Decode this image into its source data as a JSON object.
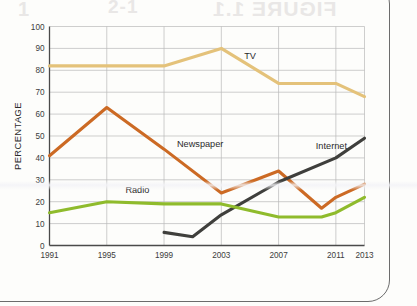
{
  "page": {
    "background_color": "#fdfdfb",
    "frame_color": "#6c6c6c",
    "bleed_through": {
      "left": "1",
      "middle": "2-1",
      "right": "FIGURE 1.1"
    }
  },
  "chart_data": {
    "type": "line",
    "title": "",
    "subtitle": "",
    "xlabel": "",
    "ylabel": "PERCENTAGE",
    "x": [
      1991,
      1995,
      1999,
      2003,
      2007,
      2011,
      2013
    ],
    "xticklabels": [
      "1991",
      "1995",
      "1999",
      "2003",
      "2007",
      "2011",
      "2013"
    ],
    "xlim": [
      1991,
      2013
    ],
    "ylim": [
      0,
      100
    ],
    "yticks": [
      0,
      10,
      20,
      30,
      40,
      50,
      60,
      70,
      80,
      90,
      100
    ],
    "yticklabels": [
      "0",
      "10",
      "20",
      "30",
      "40",
      "50",
      "60",
      "70",
      "80",
      "90",
      "100"
    ],
    "grid": true,
    "grid_color": "#b9b9b9",
    "legend_position": "inline-labels",
    "series": [
      {
        "name": "TV",
        "color": "#e4c27a",
        "label_x": 2004.6,
        "label_y": 85,
        "points": [
          {
            "x": 1991,
            "y": 82
          },
          {
            "x": 1995,
            "y": 82
          },
          {
            "x": 1999,
            "y": 82
          },
          {
            "x": 2003,
            "y": 90
          },
          {
            "x": 2007,
            "y": 74
          },
          {
            "x": 2011,
            "y": 74
          },
          {
            "x": 2013,
            "y": 68
          }
        ]
      },
      {
        "name": "Newspaper",
        "color": "#cc6a24",
        "label_x": 1999.9,
        "label_y": 45,
        "points": [
          {
            "x": 1991,
            "y": 41
          },
          {
            "x": 1995,
            "y": 63
          },
          {
            "x": 1999,
            "y": 44
          },
          {
            "x": 2003,
            "y": 24
          },
          {
            "x": 2007,
            "y": 34
          },
          {
            "x": 2010,
            "y": 17
          },
          {
            "x": 2011,
            "y": 22
          },
          {
            "x": 2013,
            "y": 28
          }
        ]
      },
      {
        "name": "Internet",
        "color": "#3f3f3c",
        "label_x": 2009.6,
        "label_y": 44,
        "points": [
          {
            "x": 1999,
            "y": 6
          },
          {
            "x": 2001,
            "y": 4
          },
          {
            "x": 2003,
            "y": 14
          },
          {
            "x": 2007,
            "y": 29
          },
          {
            "x": 2011,
            "y": 40
          },
          {
            "x": 2013,
            "y": 49
          }
        ]
      },
      {
        "name": "Radio",
        "color": "#8fbb2c",
        "label_x": 1996.3,
        "label_y": 24,
        "points": [
          {
            "x": 1991,
            "y": 15
          },
          {
            "x": 1995,
            "y": 20
          },
          {
            "x": 1999,
            "y": 19
          },
          {
            "x": 2003,
            "y": 19
          },
          {
            "x": 2007,
            "y": 13
          },
          {
            "x": 2010,
            "y": 13
          },
          {
            "x": 2011,
            "y": 15
          },
          {
            "x": 2013,
            "y": 22
          }
        ]
      }
    ]
  }
}
